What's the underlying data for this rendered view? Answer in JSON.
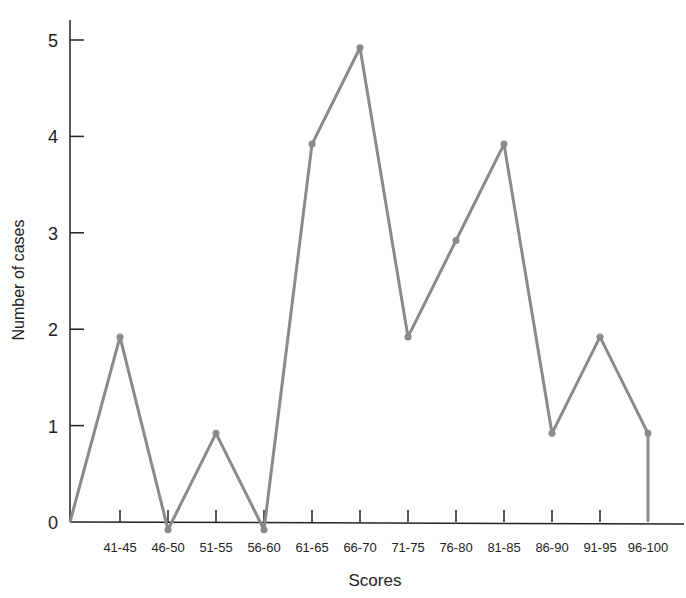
{
  "chart_data": {
    "type": "line",
    "title": "",
    "xlabel": "Scores",
    "ylabel": "Number of cases",
    "categories": [
      "41-45",
      "46-50",
      "51-55",
      "56-60",
      "61-65",
      "66-70",
      "71-75",
      "76-80",
      "81-85",
      "86-90",
      "91-95",
      "96-100"
    ],
    "series": [
      {
        "name": "Number of cases",
        "values": [
          2,
          0,
          1,
          0,
          4,
          5,
          2,
          3,
          4,
          1,
          2,
          1
        ],
        "color": "#8a8a8a"
      }
    ],
    "start_point": {
      "x": "origin",
      "y": 0
    },
    "end_drop_to_zero": true,
    "ylim": [
      0,
      5
    ],
    "yticks": [
      0,
      1,
      2,
      3,
      4,
      5
    ],
    "grid": false,
    "legend": "none"
  },
  "axes": {
    "y_tick_labels": [
      "0",
      "1",
      "2",
      "3",
      "4",
      "5"
    ],
    "x_title": "Scores",
    "y_title": "Number of cases"
  },
  "colors": {
    "line": "#8a8a8a",
    "axis": "#222222"
  }
}
